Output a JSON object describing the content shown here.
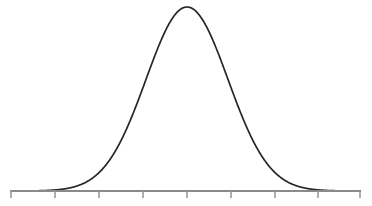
{
  "chart_data": {
    "type": "line",
    "title": "",
    "subtitle": "",
    "xlabel": "",
    "ylabel": "",
    "grid": false,
    "legend": null,
    "legend_position": "none",
    "annotations": [],
    "distribution": {
      "kind": "normal",
      "mean_px": 187,
      "sigma_px": 41,
      "peak_px": {
        "x": 187,
        "y": 7
      },
      "baseline_y_px": 191,
      "amplitude_px": 184
    },
    "xlim": [
      -4,
      4
    ],
    "ylim": [
      0,
      1
    ],
    "x_tick_labels": [
      "",
      "",
      "",
      "",
      "",
      "",
      "",
      "",
      ""
    ],
    "y_tick_labels": [],
    "x_tick_values": [
      -4,
      -3,
      -2,
      -1,
      0,
      1,
      2,
      3,
      4
    ],
    "x": [
      -4.0,
      -3.75,
      -3.5,
      -3.25,
      -3.0,
      -2.75,
      -2.5,
      -2.25,
      -2.0,
      -1.75,
      -1.5,
      -1.25,
      -1.0,
      -0.75,
      -0.5,
      -0.25,
      0.0,
      0.25,
      0.5,
      0.75,
      1.0,
      1.25,
      1.5,
      1.75,
      2.0,
      2.25,
      2.5,
      2.75,
      3.0,
      3.25,
      3.5,
      3.75,
      4.0
    ],
    "values": [
      0.0003,
      0.0009,
      0.0022,
      0.0051,
      0.0111,
      0.0228,
      0.0439,
      0.0796,
      0.1353,
      0.2163,
      0.3247,
      0.4578,
      0.6065,
      0.7548,
      0.8825,
      0.9692,
      1.0,
      0.9692,
      0.8825,
      0.7548,
      0.6065,
      0.4578,
      0.3247,
      0.2163,
      0.1353,
      0.0796,
      0.0439,
      0.0228,
      0.0111,
      0.0051,
      0.0022,
      0.0009,
      0.0003
    ],
    "series": [
      {
        "name": "normal-distribution",
        "values": [
          0.0003,
          0.0009,
          0.0022,
          0.0051,
          0.0111,
          0.0228,
          0.0439,
          0.0796,
          0.1353,
          0.2163,
          0.3247,
          0.4578,
          0.6065,
          0.7548,
          0.8825,
          0.9692,
          1.0,
          0.9692,
          0.8825,
          0.7548,
          0.6065,
          0.4578,
          0.3247,
          0.2163,
          0.1353,
          0.0796,
          0.0439,
          0.0228,
          0.0111,
          0.0051,
          0.0022,
          0.0009,
          0.0003
        ]
      }
    ]
  },
  "axis": {
    "orientation": "horizontal",
    "x_start_px": 11,
    "x_end_px": 360,
    "y_px": 191,
    "stroke_width_px": 2,
    "tick_count": 9,
    "tick_positions_px": [
      11,
      55,
      99,
      143,
      187,
      231,
      275,
      318,
      360
    ],
    "tick_length_px": 7,
    "tick_stroke_width_px": 1.6
  },
  "colors": {
    "background": "#ffffff",
    "curve": "#262626",
    "axis": "#8a8a8a",
    "tick": "#9a9a9a"
  },
  "geometry": {
    "width_px": 372,
    "height_px": 206,
    "curve_stroke_width_px": 1.7
  },
  "labels": {
    "chart_name": "Bell Curve",
    "curve_name": "Normal Distribution Curve",
    "axis_name": "Horizontal Axis"
  }
}
